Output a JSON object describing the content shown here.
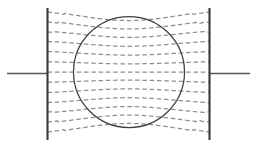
{
  "figure": {
    "caption": "",
    "background_color": "#ffffff",
    "width": 257,
    "height": 147
  },
  "colors": {
    "plate": "#3a3a3a",
    "lead": "#585858",
    "sphere": "#3f3f3f",
    "field_line": "#8d8d8d"
  },
  "elements": {
    "left_plate": {
      "label": "left-plate",
      "x": 47.5,
      "y_top": 8,
      "y_bottom": 140,
      "stroke_width": 2.1
    },
    "right_plate": {
      "label": "right-plate",
      "x": 209.5,
      "y_top": 8,
      "y_bottom": 140,
      "stroke_width": 2.1
    },
    "left_lead": {
      "label": "left-lead-wire",
      "x_start": 7,
      "x_end": 47.5,
      "y": 73.5
    },
    "right_lead": {
      "label": "right-lead-wire",
      "x_start": 209.5,
      "x_end": 250,
      "y": 73.5
    },
    "sphere": {
      "label": "conducting-sphere",
      "cx": 129,
      "cy": 72,
      "r": 55.5
    }
  },
  "chart_data": {
    "type": "line",
    "xlabel": "",
    "ylabel": "",
    "xlim": [
      0,
      257
    ],
    "ylim": [
      0,
      147
    ],
    "grid": false,
    "legend": null,
    "annotations": [],
    "style": {
      "dash_pattern": "4.5 2.8",
      "line_width": 1.25,
      "line_color": "#8d8d8d"
    },
    "geometry": {
      "plate_left_x": 47.5,
      "plate_right_x": 209.5,
      "plate_top_y": 8,
      "plate_bottom_y": 140,
      "sphere_center_x": 129,
      "sphere_center_y": 72,
      "sphere_radius": 55.5,
      "symmetry_axis_y": 72
    },
    "field_line_count": 13,
    "series": [
      {
        "name": "field-line-1",
        "y_at_plate": 12,
        "y_at_center": 22.5,
        "bow": 10.5
      },
      {
        "name": "field-line-2",
        "y_at_plate": 22,
        "y_at_center": 30.5,
        "bow": 8.5
      },
      {
        "name": "field-line-3",
        "y_at_plate": 32,
        "y_at_center": 38.5,
        "bow": 6.5
      },
      {
        "name": "field-line-4",
        "y_at_plate": 42,
        "y_at_center": 47.0,
        "bow": 5.0
      },
      {
        "name": "field-line-5",
        "y_at_plate": 52,
        "y_at_center": 55.5,
        "bow": 3.5
      },
      {
        "name": "field-line-6",
        "y_at_plate": 62,
        "y_at_center": 64.0,
        "bow": 2.0
      },
      {
        "name": "field-line-7",
        "y_at_plate": 72,
        "y_at_center": 72.0,
        "bow": 0.0
      },
      {
        "name": "field-line-8",
        "y_at_plate": 82,
        "y_at_center": 80.0,
        "bow": -2.0
      },
      {
        "name": "field-line-9",
        "y_at_plate": 92,
        "y_at_center": 88.5,
        "bow": -3.5
      },
      {
        "name": "field-line-10",
        "y_at_plate": 102,
        "y_at_center": 97.0,
        "bow": -5.0
      },
      {
        "name": "field-line-11",
        "y_at_plate": 112,
        "y_at_center": 105.5,
        "bow": -6.5
      },
      {
        "name": "field-line-12",
        "y_at_plate": 122,
        "y_at_center": 113.5,
        "bow": -8.5
      },
      {
        "name": "field-line-13",
        "y_at_plate": 132,
        "y_at_center": 121.5,
        "bow": -10.5
      }
    ]
  }
}
